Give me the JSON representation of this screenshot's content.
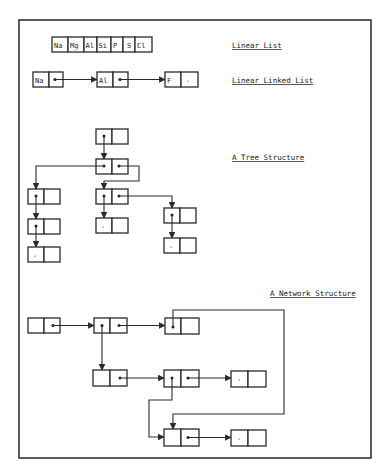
{
  "labels": {
    "linear_list": "Linear List",
    "linked_list": "Linear Linked List",
    "tree": "A Tree Structure",
    "network": "A Network Structure"
  },
  "linear_list": {
    "elements": [
      "Na",
      "Mg",
      "Al",
      "Si",
      "P",
      "S",
      "Cl"
    ]
  },
  "linked_list": {
    "nodes": [
      {
        "value": "Na",
        "pointer": "next"
      },
      {
        "value": "Al",
        "pointer": "next"
      },
      {
        "value": "F",
        "pointer": "null"
      }
    ]
  },
  "null_marker": "-",
  "tree": {
    "node_count": 9,
    "leaf_count": 3,
    "description": "Root -> child with two pointers; left branch chain of 3 nodes, middle branch 2 nodes, right branch 2 nodes"
  },
  "network": {
    "node_count": 8,
    "description": "Nodes with multiple inbound pointers, including a loop from the top-right node back to a lower node"
  },
  "colors": {
    "ink": "#2a2a2a",
    "background": "#ffffff"
  }
}
